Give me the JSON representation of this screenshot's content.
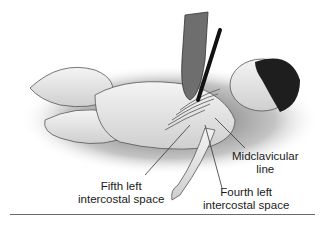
{
  "figure": {
    "labels": {
      "midclavicular": {
        "line1": "Midclavicular",
        "line2": "line"
      },
      "fourth": {
        "line1": "Fourth left",
        "line2": "intercostal space"
      },
      "fifth": {
        "line1": "Fifth left",
        "line2": "intercostal space"
      }
    }
  }
}
